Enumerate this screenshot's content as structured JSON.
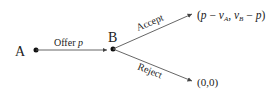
{
  "nodes": {
    "a": {
      "label": "A"
    },
    "b": {
      "label": "B"
    }
  },
  "edges": {
    "offer": {
      "label_text": "Offer ",
      "label_var": "p"
    },
    "accept": {
      "label": "Accept"
    },
    "reject": {
      "label": "Reject"
    }
  },
  "payoffs": {
    "accept": "(p − v_A, v_B − p)",
    "accept_parts": {
      "open": "(",
      "p1": "p",
      "minus1": " − ",
      "vA": "v",
      "vA_sub": "A",
      "comma": ", ",
      "vB": "v",
      "vB_sub": "B",
      "minus2": " − ",
      "p2": "p",
      "close": ")"
    },
    "reject": "(0,0)"
  },
  "colors": {
    "line": "#555555",
    "dot": "#111111",
    "text": "#222222"
  }
}
